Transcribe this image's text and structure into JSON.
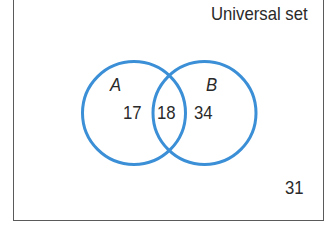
{
  "diagram": {
    "type": "venn",
    "universal_label": "Universal set",
    "circle_color": "#3b8fd6",
    "frame_color": "#5a5a5a",
    "sets": [
      {
        "name": "A",
        "label": "A"
      },
      {
        "name": "B",
        "label": "B"
      }
    ],
    "regions": {
      "a_only": "17",
      "a_and_b": "18",
      "b_only": "34",
      "outside": "31"
    }
  }
}
